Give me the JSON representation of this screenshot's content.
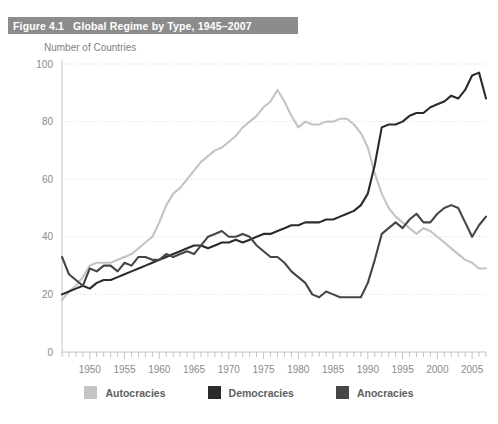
{
  "figure": {
    "number_label": "Figure 4.1",
    "title": "Global Regime by Type, 1945–2007",
    "band_color": "#8c8c8c",
    "title_color": "#ffffff"
  },
  "axis_caption": "Number of Countries",
  "legend": {
    "items": [
      {
        "label": "Autocracies",
        "color": "#c4c4c4"
      },
      {
        "label": "Democracies",
        "color": "#2b2b2b"
      },
      {
        "label": "Anocracies",
        "color": "#464646"
      }
    ]
  },
  "chart_data": {
    "type": "line",
    "title": "Global Regime by Type, 1945–2007",
    "xlabel": "",
    "ylabel": "Number of Countries",
    "xlim": [
      1946,
      2007
    ],
    "ylim": [
      0,
      100
    ],
    "yticks": [
      0,
      20,
      40,
      60,
      80,
      100
    ],
    "xticks": [
      1950,
      1955,
      1960,
      1965,
      1970,
      1975,
      1980,
      1985,
      1990,
      1995,
      2000,
      2005
    ],
    "x_minor_tick_step": 1,
    "grid": true,
    "grid_axis": "y",
    "legend_position": "bottom",
    "x": [
      1946,
      1947,
      1948,
      1949,
      1950,
      1951,
      1952,
      1953,
      1954,
      1955,
      1956,
      1957,
      1958,
      1959,
      1960,
      1961,
      1962,
      1963,
      1964,
      1965,
      1966,
      1967,
      1968,
      1969,
      1970,
      1971,
      1972,
      1973,
      1974,
      1975,
      1976,
      1977,
      1978,
      1979,
      1980,
      1981,
      1982,
      1983,
      1984,
      1985,
      1986,
      1987,
      1988,
      1989,
      1990,
      1991,
      1992,
      1993,
      1994,
      1995,
      1996,
      1997,
      1998,
      1999,
      2000,
      2001,
      2002,
      2003,
      2004,
      2005,
      2006,
      2007
    ],
    "series": [
      {
        "name": "Autocracies",
        "color": "#c4c4c4",
        "values": [
          18,
          21,
          23,
          26,
          30,
          31,
          31,
          31,
          32,
          33,
          34,
          36,
          38,
          40,
          45,
          51,
          55,
          57,
          60,
          63,
          66,
          68,
          70,
          71,
          73,
          75,
          78,
          80,
          82,
          85,
          87,
          91,
          87,
          82,
          78,
          80,
          79,
          79,
          80,
          80,
          81,
          81,
          79,
          76,
          71,
          62,
          55,
          50,
          47,
          45,
          43,
          41,
          43,
          42,
          40,
          38,
          36,
          34,
          32,
          31,
          29,
          29
        ]
      },
      {
        "name": "Democracies",
        "color": "#2b2b2b",
        "values": [
          20,
          21,
          22,
          23,
          22,
          24,
          25,
          25,
          26,
          27,
          28,
          29,
          30,
          31,
          32,
          33,
          34,
          35,
          36,
          37,
          37,
          36,
          37,
          38,
          38,
          39,
          38,
          39,
          40,
          41,
          41,
          42,
          43,
          44,
          44,
          45,
          45,
          45,
          46,
          46,
          47,
          48,
          49,
          51,
          55,
          65,
          78,
          79,
          79,
          80,
          82,
          83,
          83,
          85,
          86,
          87,
          89,
          88,
          91,
          96,
          97,
          88
        ]
      },
      {
        "name": "Anocracies",
        "color": "#464646",
        "values": [
          33,
          27,
          25,
          23,
          29,
          28,
          30,
          30,
          28,
          31,
          30,
          33,
          33,
          32,
          32,
          34,
          33,
          34,
          35,
          34,
          37,
          40,
          41,
          42,
          40,
          40,
          41,
          40,
          37,
          35,
          33,
          33,
          31,
          28,
          26,
          24,
          20,
          19,
          21,
          20,
          19,
          19,
          19,
          19,
          24,
          32,
          41,
          43,
          45,
          43,
          46,
          48,
          45,
          45,
          48,
          50,
          51,
          50,
          45,
          40,
          44,
          47
        ]
      }
    ]
  }
}
